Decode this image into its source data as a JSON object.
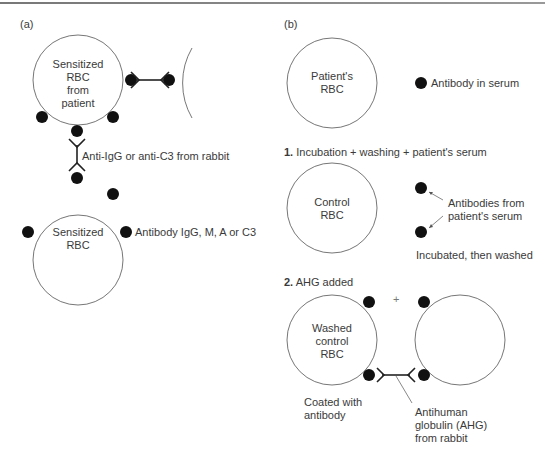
{
  "panel_a": {
    "label": "(a)",
    "top_cell": {
      "line1": "Sensitized",
      "line2": "RBC",
      "line3": "from",
      "line4": "patient"
    },
    "bottom_cell": {
      "line1": "Sensitized",
      "line2": "RBC"
    },
    "anti_label": "Anti-IgG or anti-C3 from rabbit",
    "antibody_label": "Antibody IgG, M, A or C3"
  },
  "panel_b": {
    "label": "(b)",
    "patient_cell": {
      "line1": "Patient's",
      "line2": "RBC"
    },
    "antibody_serum_label": "Antibody in serum",
    "step1": {
      "num": "1.",
      "text": "Incubation + washing + patient's serum"
    },
    "control_cell": {
      "line1": "Control",
      "line2": "RBC"
    },
    "antibodies_from": {
      "line1": "Antibodies from",
      "line2": "patient's serum"
    },
    "incubated_label": "Incubated, then washed",
    "step2": {
      "num": "2.",
      "text": "AHG added"
    },
    "washed_cell": {
      "line1": "Washed",
      "line2": "control",
      "line3": "RBC"
    },
    "plus_sign": "+",
    "coated": {
      "line1": "Coated with",
      "line2": "antibody"
    },
    "ahg": {
      "line1": "Antihuman",
      "line2": "globulin (AHG)",
      "line3": "from rabbit"
    }
  },
  "colors": {
    "line": "#555555",
    "dot": "#111111",
    "text": "#3a3a3a"
  }
}
